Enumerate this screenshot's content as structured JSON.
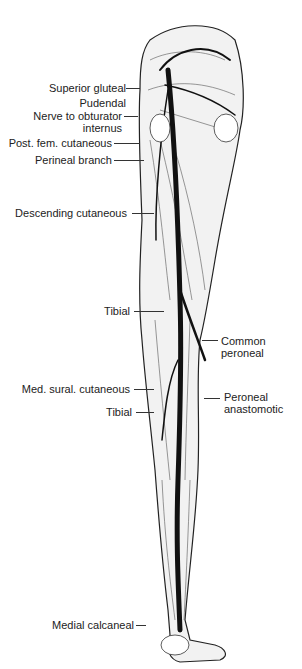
{
  "figure": {
    "labels_left": [
      {
        "id": "superior-gluteal",
        "text": "Superior gluteal"
      },
      {
        "id": "pudendal",
        "text": "Pudendal"
      },
      {
        "id": "nerve-obturator",
        "text": "Nerve to obturator"
      },
      {
        "id": "internus",
        "text": "internus"
      },
      {
        "id": "post-fem-cutaneous",
        "text": "Post. fem. cutaneous"
      },
      {
        "id": "perineal-branch",
        "text": "Perineal branch"
      },
      {
        "id": "descending-cutaneous",
        "text": "Descending cutaneous"
      },
      {
        "id": "tibial-upper",
        "text": "Tibial"
      },
      {
        "id": "med-sural-cutaneous",
        "text": "Med. sural. cutaneous"
      },
      {
        "id": "tibial-lower",
        "text": "Tibial"
      },
      {
        "id": "medial-calcaneal",
        "text": "Medial calcaneal"
      }
    ],
    "labels_right": [
      {
        "id": "common-peroneal-1",
        "text": "Common"
      },
      {
        "id": "common-peroneal-2",
        "text": "peroneal"
      },
      {
        "id": "peroneal-anastomotic-1",
        "text": "Peroneal"
      },
      {
        "id": "peroneal-anastomotic-2",
        "text": "anastomotic"
      }
    ],
    "muscle_labels": [
      "BICEPS",
      "FLEX. DIG. LONG.",
      "FLEX. HALL. LONG.",
      "Greater Troch.",
      "PIRIFORMIS",
      "GLUT. MED."
    ]
  }
}
